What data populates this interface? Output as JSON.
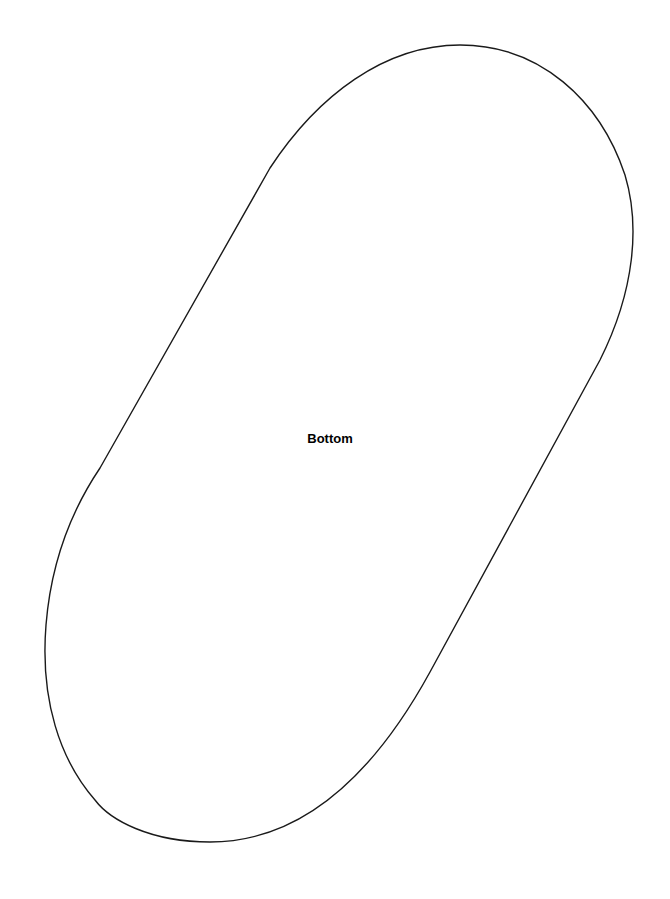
{
  "diagram": {
    "label": "Bottom",
    "shape": "rounded capsule outline (tilted)",
    "colors": {
      "background": "#ffffff",
      "outline": "#1a1a1a",
      "label": "#000000"
    }
  }
}
